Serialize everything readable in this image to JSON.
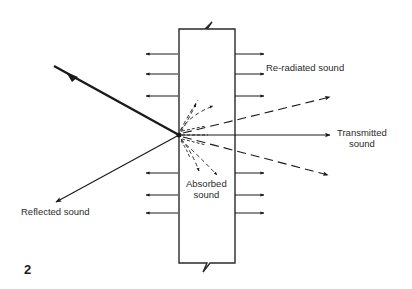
{
  "diagram": {
    "figure_number": "2",
    "labels": {
      "reradiated": "Re-radiated sound",
      "transmitted_line1": "Transmitted",
      "transmitted_line2": "sound",
      "absorbed_line1": "Absorbed",
      "absorbed_line2": "sound",
      "reflected": "Reflected sound"
    },
    "colors": {
      "ink": "#1a1a1a",
      "background": "#ffffff"
    }
  }
}
